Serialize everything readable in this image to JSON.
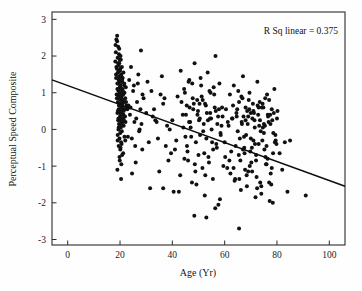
{
  "chart_data": {
    "type": "scatter",
    "title": "",
    "xlabel": "Age (Yr)",
    "ylabel": "Perceptual Speed Composite",
    "xlim": [
      -6,
      106
    ],
    "ylim": [
      -3.15,
      3.2
    ],
    "xticks": [
      0,
      20,
      40,
      60,
      80,
      100
    ],
    "xtick_labels": [
      "0",
      "20",
      "40",
      "60",
      "80",
      "100"
    ],
    "yticks": [
      -3,
      -2,
      -1,
      0,
      1,
      2,
      3
    ],
    "ytick_labels": [
      "-3",
      "-2",
      "-1",
      "0",
      "1",
      "2",
      "3"
    ],
    "grid": false,
    "legend": null,
    "annotations": [
      {
        "text": "R Sq linear = 0.375",
        "x": 96,
        "y": 2.78,
        "align": "right"
      }
    ],
    "fit_line": {
      "type": "linear",
      "r_squared": 0.375,
      "intercept": 1.5,
      "slope": -0.0258,
      "x_start": -6,
      "y_start": 1.35,
      "x_end": 106,
      "y_end": -1.55
    },
    "marker": {
      "shape": "circle",
      "size": 2.0,
      "color": "#111111"
    },
    "series": [
      {
        "name": "participants",
        "x": [
          18.2,
          18.4,
          18.5,
          18.6,
          18.7,
          18.8,
          18.9,
          19.0,
          19.0,
          19.1,
          19.1,
          19.2,
          19.2,
          19.3,
          19.3,
          19.4,
          19.4,
          19.5,
          19.5,
          19.5,
          19.6,
          19.6,
          19.7,
          19.7,
          19.8,
          19.8,
          19.9,
          19.9,
          20.0,
          20.0,
          20.0,
          20.1,
          20.1,
          20.2,
          20.2,
          20.3,
          20.3,
          20.4,
          20.4,
          20.5,
          20.5,
          20.6,
          20.6,
          20.7,
          20.7,
          20.8,
          20.9,
          21.0,
          21.0,
          21.1,
          21.2,
          21.3,
          21.4,
          21.5,
          21.6,
          21.7,
          21.8,
          22.0,
          22.2,
          22.5,
          18.3,
          18.6,
          18.9,
          19.0,
          19.2,
          19.3,
          19.4,
          19.5,
          19.6,
          19.7,
          19.8,
          19.9,
          20.0,
          20.1,
          20.2,
          20.3,
          20.4,
          20.5,
          20.6,
          20.7,
          20.8,
          20.9,
          21.0,
          21.1,
          21.2,
          21.4,
          21.6,
          21.9,
          22.3,
          22.8,
          18.5,
          18.8,
          19.1,
          19.3,
          19.5,
          19.6,
          19.7,
          19.8,
          19.9,
          20.0,
          20.1,
          20.2,
          20.3,
          20.4,
          20.5,
          20.6,
          20.7,
          20.8,
          21.0,
          21.3,
          21.7,
          22.1,
          22.6,
          23.0,
          19.0,
          19.4,
          19.7,
          19.9,
          20.0,
          20.2,
          20.4,
          20.6,
          20.8,
          21.1,
          21.5,
          22.0,
          23.5,
          24.0,
          24.5,
          25.0,
          25.5,
          26.0,
          26.5,
          27.0,
          27.5,
          28.0,
          28.5,
          29.0,
          23.8,
          24.6,
          25.3,
          26.2,
          27.3,
          28.6,
          24.2,
          25.8,
          27.8,
          26.8,
          23.2,
          28.2,
          30.0,
          31.0,
          32.0,
          33.5,
          35.0,
          36.5,
          38.0,
          39.5,
          30.5,
          32.5,
          34.5,
          37.0,
          39.0,
          31.5,
          33.0,
          36.0,
          38.5,
          34.0,
          35.5,
          37.5,
          40.0,
          41.0,
          42.0,
          43.0,
          44.0,
          44.5,
          45.0,
          45.5,
          46.0,
          46.5,
          47.0,
          47.5,
          48.0,
          48.5,
          49.0,
          49.5,
          50.0,
          50.5,
          51.0,
          51.5,
          52.0,
          52.5,
          53.0,
          53.5,
          54.0,
          54.5,
          55.0,
          55.5,
          56.0,
          56.5,
          57.0,
          57.5,
          58.0,
          58.5,
          59.0,
          59.5,
          41.5,
          43.5,
          44.8,
          45.8,
          46.8,
          47.8,
          48.8,
          49.8,
          50.8,
          51.8,
          52.8,
          53.8,
          54.8,
          55.8,
          56.8,
          57.8,
          58.8,
          42.5,
          45.2,
          46.2,
          47.2,
          48.2,
          49.2,
          50.2,
          51.2,
          52.2,
          53.2,
          54.2,
          55.2,
          56.2,
          57.2,
          58.2,
          59.2,
          44.2,
          45.6,
          46.6,
          47.6,
          48.6,
          49.6,
          50.6,
          51.6,
          52.6,
          53.6,
          54.6,
          55.6,
          56.6,
          57.6,
          43.2,
          44.6,
          46.4,
          48.4,
          50.4,
          52.4,
          54.4,
          56.4,
          58.4,
          60.0,
          60.5,
          61.0,
          61.5,
          62.0,
          62.5,
          63.0,
          63.5,
          64.0,
          64.5,
          65.0,
          65.5,
          66.0,
          66.5,
          67.0,
          67.5,
          68.0,
          68.5,
          69.0,
          69.5,
          70.0,
          70.5,
          71.0,
          71.5,
          72.0,
          72.5,
          73.0,
          73.5,
          74.0,
          74.5,
          75.0,
          75.5,
          76.0,
          76.5,
          77.0,
          77.5,
          78.0,
          78.5,
          79.0,
          79.5,
          80.0,
          60.2,
          61.2,
          62.2,
          63.2,
          64.2,
          65.2,
          66.2,
          67.2,
          68.2,
          69.2,
          70.2,
          71.2,
          72.2,
          73.2,
          74.2,
          75.2,
          76.2,
          77.2,
          78.2,
          79.2,
          80.2,
          61.8,
          62.8,
          63.8,
          64.8,
          65.8,
          66.8,
          67.8,
          68.8,
          69.8,
          70.8,
          71.8,
          72.8,
          73.8,
          74.8,
          75.8,
          76.8,
          77.8,
          78.8,
          79.8,
          63.4,
          64.6,
          65.4,
          66.4,
          67.4,
          68.4,
          69.4,
          70.4,
          71.4,
          72.4,
          73.4,
          74.4,
          75.4,
          76.4,
          77.4,
          78.4,
          79.4,
          65.6,
          66.6,
          67.6,
          68.6,
          69.6,
          70.6,
          71.6,
          72.6,
          73.6,
          74.6,
          75.6,
          76.6,
          77.6,
          78.6,
          67.0,
          68.0,
          69.0,
          70.0,
          71.0,
          72.0,
          73.0,
          74.0,
          75.0,
          76.0,
          77.0,
          78.0,
          81.0,
          82.0,
          83.0,
          84.0,
          85.0,
          91.0,
          53.0,
          65.5,
          36.5,
          40.5
        ],
        "y": [
          1.85,
          2.1,
          1.4,
          2.45,
          0.95,
          1.65,
          2.55,
          0.45,
          1.25,
          1.95,
          -0.15,
          0.75,
          1.55,
          2.25,
          0.25,
          1.05,
          1.75,
          -0.45,
          0.55,
          1.35,
          2.05,
          0.15,
          0.85,
          1.45,
          -0.25,
          0.65,
          1.15,
          1.9,
          0.35,
          1.0,
          1.6,
          -0.55,
          0.45,
          1.2,
          2.0,
          0.05,
          0.8,
          1.5,
          -0.35,
          0.6,
          1.3,
          0.2,
          0.9,
          1.7,
          -0.05,
          0.7,
          1.1,
          0.4,
          1.4,
          0.3,
          0.95,
          1.55,
          0.1,
          0.75,
          1.25,
          -0.2,
          0.55,
          0.85,
          1.15,
          0.65,
          2.3,
          1.7,
          2.4,
          1.1,
          0.5,
          1.8,
          0.0,
          0.9,
          1.6,
          2.2,
          0.3,
          1.3,
          0.7,
          -0.1,
          1.0,
          1.9,
          0.4,
          1.45,
          -0.4,
          0.8,
          1.35,
          0.2,
          0.6,
          1.05,
          -0.65,
          0.5,
          1.2,
          0.35,
          0.75,
          0.55,
          1.5,
          0.85,
          -0.3,
          1.25,
          0.05,
          0.65,
          1.4,
          -0.75,
          0.95,
          0.25,
          1.65,
          -0.5,
          0.45,
          1.1,
          -0.95,
          0.55,
          1.3,
          0.15,
          0.7,
          0.4,
          1.0,
          0.2,
          0.6,
          -0.2,
          -1.1,
          0.3,
          1.8,
          -0.85,
          0.1,
          1.0,
          -1.35,
          0.5,
          -0.7,
          0.8,
          0.25,
          -0.3,
          1.35,
          0.6,
          -0.25,
          1.05,
          0.2,
          -0.9,
          0.75,
          1.5,
          0.0,
          2.15,
          -0.55,
          0.85,
          0.4,
          -1.2,
          1.2,
          0.3,
          -0.05,
          0.95,
          1.7,
          -0.45,
          0.55,
          1.25,
          0.65,
          0.15,
          0.45,
          -0.35,
          1.05,
          0.25,
          -1.15,
          0.7,
          0.1,
          -0.65,
          1.3,
          0.35,
          -0.25,
          0.85,
          0.0,
          -1.6,
          0.55,
          1.45,
          -0.85,
          0.2,
          0.95,
          -0.45,
          0.25,
          -0.55,
          0.9,
          -1.25,
          0.4,
          1.1,
          -0.2,
          0.65,
          -0.85,
          1.35,
          0.05,
          -1.45,
          0.55,
          1.8,
          -0.35,
          0.8,
          -0.7,
          0.3,
          1.2,
          -1.05,
          0.15,
          0.7,
          -0.25,
          1.55,
          -0.9,
          0.45,
          0.0,
          -1.35,
          0.95,
          2.0,
          -0.5,
          0.35,
          1.25,
          -0.15,
          0.6,
          -1.0,
          -0.3,
          0.75,
          1.0,
          -0.6,
          0.2,
          0.85,
          -1.15,
          0.5,
          1.4,
          -0.05,
          0.65,
          -0.75,
          0.3,
          1.15,
          -0.4,
          0.55,
          0.1,
          -1.7,
          0.4,
          1.3,
          -0.2,
          0.7,
          -1.5,
          0.25,
          0.9,
          -0.65,
          0.45,
          1.05,
          -0.35,
          0.6,
          0.15,
          -1.9,
          0.35,
          0.05,
          -0.45,
          0.6,
          1.25,
          -0.95,
          0.4,
          -0.15,
          0.8,
          -1.25,
          0.25,
          1.0,
          -0.55,
          0.5,
          -2.05,
          1.6,
          -0.8,
          0.2,
          -2.35,
          0.7,
          -1.8,
          0.3,
          -2.15,
          -0.1,
          -0.35,
          0.55,
          -1.05,
          0.1,
          0.95,
          -0.6,
          0.3,
          1.2,
          -1.35,
          0.45,
          -0.05,
          0.75,
          -0.85,
          0.2,
          1.45,
          -0.5,
          0.6,
          -1.55,
          0.35,
          1.0,
          -0.25,
          -1.15,
          0.5,
          0.05,
          -0.7,
          1.3,
          -0.4,
          0.25,
          -1.75,
          0.7,
          -0.1,
          0.85,
          -0.95,
          0.4,
          -1.45,
          0.15,
          0.55,
          -0.65,
          1.1,
          -0.3,
          0.3,
          -0.75,
          0.2,
          -1.2,
          0.65,
          -0.45,
          1.05,
          -1.65,
          0.35,
          -0.15,
          0.8,
          -0.9,
          0.45,
          -1.3,
          0.1,
          0.6,
          -0.55,
          0.95,
          -1.95,
          0.25,
          -0.35,
          0.5,
          -0.85,
          0.3,
          -1.4,
          0.55,
          -0.25,
          0.85,
          -1.1,
          0.15,
          -0.6,
          0.7,
          -1.85,
          0.4,
          -0.05,
          0.6,
          -0.95,
          0.2,
          -1.5,
          0.45,
          -0.4,
          -1.05,
          0.35,
          -0.7,
          0.9,
          -0.2,
          -1.25,
          0.55,
          -0.5,
          0.25,
          -1.6,
          0.75,
          -0.3,
          0.1,
          -0.8,
          0.4,
          -2.0,
          -0.15,
          -1.35,
          0.15,
          -0.65,
          0.5,
          -1.0,
          0.3,
          -0.4,
          0.65,
          -1.45,
          0.05,
          -0.75,
          0.35,
          -1.2,
          -0.1,
          -0.55,
          0.25,
          -1.15,
          0.45,
          -0.3,
          -0.85,
          0.6,
          -1.55,
          0.15,
          -0.45,
          0.8,
          -1.05,
          -0.65,
          -1.1,
          -0.35,
          -1.7,
          -0.3,
          -1.8,
          -2.4,
          -2.7,
          -1.6,
          -1.7
        ]
      }
    ]
  },
  "axes": {
    "x_axis_name": "Age (Yr)",
    "y_axis_name": "Perceptual Speed Composite"
  },
  "annotation": {
    "r_sq_text": "R Sq linear = 0.375"
  },
  "colors": {
    "background": "#fefefe",
    "frame": "#2b2b2b",
    "marker": "#111111",
    "fit_line": "#0d0d0d",
    "text": "#161616"
  }
}
